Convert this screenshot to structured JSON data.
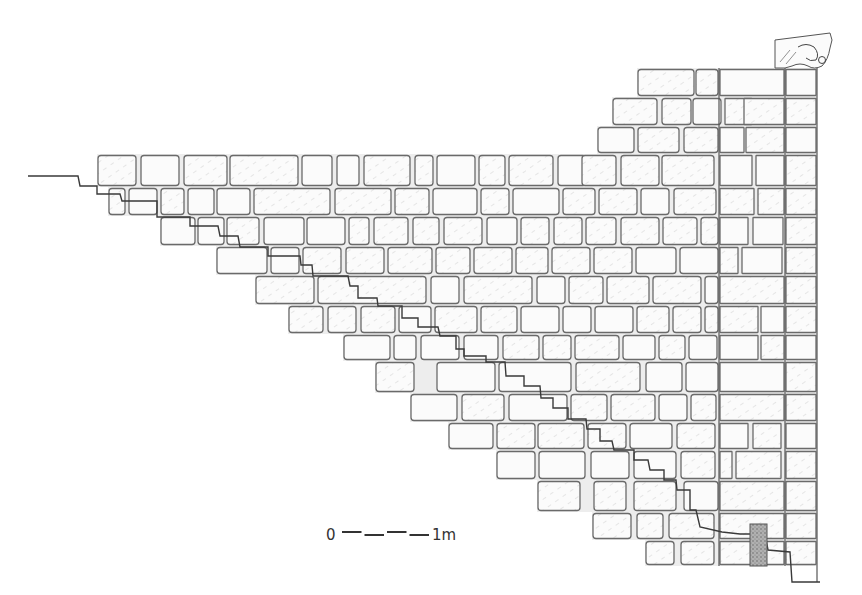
{
  "figure": {
    "scale_bar": {
      "start_label": "0",
      "end_label": "1m",
      "x": 342,
      "y": 535,
      "length": 90,
      "segments": 4
    },
    "capital_ornament": "carved corbel",
    "colors": {
      "line": "#555555",
      "stone_fill": "#fbfbfb",
      "mortar": "#ededed",
      "hatch": "#c8c8c8",
      "patch": "#9a9a9a"
    }
  },
  "courses": [
    {
      "y": 68,
      "h": 29,
      "blocks": [
        [
          637,
          58
        ],
        [
          695,
          24
        ],
        [
          719,
          66
        ],
        [
          785,
          32
        ]
      ]
    },
    {
      "y": 97,
      "h": 29,
      "blocks": [
        [
          612,
          46
        ],
        [
          661,
          31
        ],
        [
          692,
          30
        ],
        [
          724,
          29
        ],
        [
          743,
          42
        ],
        [
          785,
          32
        ]
      ]
    },
    {
      "y": 126,
      "h": 28,
      "blocks": [
        [
          597,
          38
        ],
        [
          637,
          43
        ],
        [
          683,
          36
        ],
        [
          719,
          26
        ],
        [
          745,
          40
        ],
        [
          785,
          32
        ]
      ]
    },
    {
      "y": 154,
      "h": 33,
      "blocks": [
        [
          97,
          40
        ],
        [
          140,
          40
        ],
        [
          183,
          45
        ],
        [
          229,
          70
        ],
        [
          301,
          32
        ],
        [
          336,
          24
        ],
        [
          363,
          48
        ],
        [
          414,
          20
        ],
        [
          436,
          40
        ],
        [
          478,
          28
        ],
        [
          508,
          46
        ],
        [
          557,
          30
        ],
        [
          581,
          36
        ],
        [
          620,
          40
        ],
        [
          661,
          54
        ],
        [
          719,
          34
        ],
        [
          755,
          30
        ],
        [
          785,
          32
        ]
      ]
    },
    {
      "y": 187,
      "h": 29,
      "blocks": [
        [
          108,
          18
        ],
        [
          128,
          30
        ],
        [
          160,
          25
        ],
        [
          187,
          28
        ],
        [
          216,
          35
        ],
        [
          253,
          78
        ],
        [
          334,
          58
        ],
        [
          394,
          36
        ],
        [
          432,
          46
        ],
        [
          480,
          30
        ],
        [
          512,
          48
        ],
        [
          562,
          34
        ],
        [
          598,
          40
        ],
        [
          640,
          30
        ],
        [
          673,
          44
        ],
        [
          719,
          36
        ],
        [
          757,
          28
        ],
        [
          785,
          32
        ]
      ]
    },
    {
      "y": 216,
      "h": 30,
      "blocks": [
        [
          160,
          36
        ],
        [
          197,
          28
        ],
        [
          226,
          34
        ],
        [
          263,
          42
        ],
        [
          306,
          40
        ],
        [
          348,
          22
        ],
        [
          373,
          36
        ],
        [
          412,
          28
        ],
        [
          443,
          40
        ],
        [
          486,
          32
        ],
        [
          520,
          30
        ],
        [
          553,
          30
        ],
        [
          585,
          32
        ],
        [
          620,
          40
        ],
        [
          662,
          36
        ],
        [
          700,
          19
        ],
        [
          719,
          30
        ],
        [
          752,
          32
        ],
        [
          785,
          32
        ]
      ]
    },
    {
      "y": 246,
      "h": 29,
      "blocks": [
        [
          216,
          52
        ],
        [
          270,
          30
        ],
        [
          302,
          40
        ],
        [
          345,
          40
        ],
        [
          387,
          46
        ],
        [
          435,
          36
        ],
        [
          473,
          40
        ],
        [
          515,
          34
        ],
        [
          551,
          40
        ],
        [
          593,
          40
        ],
        [
          635,
          42
        ],
        [
          679,
          40
        ],
        [
          719,
          20
        ],
        [
          741,
          42
        ],
        [
          785,
          32
        ]
      ]
    },
    {
      "y": 275,
      "h": 30,
      "blocks": [
        [
          255,
          60
        ],
        [
          317,
          110
        ],
        [
          430,
          30
        ],
        [
          463,
          70
        ],
        [
          536,
          30
        ],
        [
          568,
          36
        ],
        [
          606,
          44
        ],
        [
          652,
          50
        ],
        [
          704,
          15
        ],
        [
          719,
          66
        ],
        [
          785,
          32
        ]
      ]
    },
    {
      "y": 305,
      "h": 29,
      "blocks": [
        [
          288,
          36
        ],
        [
          327,
          30
        ],
        [
          360,
          36
        ],
        [
          398,
          34
        ],
        [
          434,
          44
        ],
        [
          480,
          38
        ],
        [
          520,
          40
        ],
        [
          562,
          30
        ],
        [
          594,
          40
        ],
        [
          636,
          34
        ],
        [
          672,
          30
        ],
        [
          704,
          15
        ],
        [
          719,
          40
        ],
        [
          760,
          25
        ],
        [
          785,
          32
        ]
      ]
    },
    {
      "y": 334,
      "h": 27,
      "blocks": [
        [
          343,
          48
        ],
        [
          393,
          24
        ],
        [
          420,
          40
        ],
        [
          463,
          36
        ],
        [
          502,
          38
        ],
        [
          542,
          30
        ],
        [
          574,
          46
        ],
        [
          622,
          34
        ],
        [
          658,
          28
        ],
        [
          688,
          30
        ],
        [
          719,
          40
        ],
        [
          760,
          25
        ],
        [
          785,
          32
        ]
      ]
    },
    {
      "y": 361,
      "h": 32,
      "blocks": [
        [
          375,
          40
        ],
        [
          436,
          60
        ],
        [
          498,
          74
        ],
        [
          575,
          66
        ],
        [
          645,
          38
        ],
        [
          685,
          34
        ],
        [
          719,
          66
        ],
        [
          785,
          32
        ]
      ]
    },
    {
      "y": 393,
      "h": 29,
      "blocks": [
        [
          410,
          48
        ],
        [
          461,
          44
        ],
        [
          508,
          60
        ],
        [
          570,
          38
        ],
        [
          610,
          46
        ],
        [
          658,
          30
        ],
        [
          690,
          27
        ],
        [
          719,
          66
        ],
        [
          785,
          32
        ]
      ]
    },
    {
      "y": 422,
      "h": 28,
      "blocks": [
        [
          448,
          46
        ],
        [
          496,
          40
        ],
        [
          537,
          48
        ],
        [
          587,
          40
        ],
        [
          629,
          44
        ],
        [
          676,
          40
        ],
        [
          719,
          30
        ],
        [
          752,
          30
        ],
        [
          785,
          32
        ]
      ]
    },
    {
      "y": 450,
      "h": 30,
      "blocks": [
        [
          496,
          40
        ],
        [
          538,
          48
        ],
        [
          590,
          40
        ],
        [
          633,
          44
        ],
        [
          680,
          36
        ],
        [
          719,
          14
        ],
        [
          735,
          47
        ],
        [
          785,
          32
        ]
      ]
    },
    {
      "y": 480,
      "h": 32,
      "blocks": [
        [
          537,
          44
        ],
        [
          593,
          34
        ],
        [
          633,
          44
        ],
        [
          683,
          36
        ],
        [
          719,
          66
        ],
        [
          785,
          32
        ]
      ]
    },
    {
      "y": 512,
      "h": 28,
      "blocks": [
        [
          592,
          40
        ],
        [
          636,
          28
        ],
        [
          668,
          47
        ],
        [
          719,
          66
        ],
        [
          785,
          32
        ]
      ]
    },
    {
      "y": 540,
      "h": 26,
      "blocks": [
        [
          645,
          30
        ],
        [
          680,
          35
        ],
        [
          719,
          66
        ],
        [
          785,
          32
        ]
      ]
    }
  ],
  "profile_points": [
    [
      28,
      176
    ],
    [
      78,
      176
    ],
    [
      80,
      186
    ],
    [
      97,
      186
    ],
    [
      97,
      194
    ],
    [
      120,
      194
    ],
    [
      122,
      201
    ],
    [
      157,
      201
    ],
    [
      157,
      217
    ],
    [
      190,
      217
    ],
    [
      190,
      226
    ],
    [
      218,
      226
    ],
    [
      220,
      236
    ],
    [
      238,
      236
    ],
    [
      240,
      247
    ],
    [
      268,
      247
    ],
    [
      268,
      256
    ],
    [
      300,
      256
    ],
    [
      301,
      265
    ],
    [
      312,
      265
    ],
    [
      313,
      276
    ],
    [
      348,
      276
    ],
    [
      350,
      286
    ],
    [
      358,
      286
    ],
    [
      358,
      298
    ],
    [
      377,
      298
    ],
    [
      378,
      306
    ],
    [
      402,
      306
    ],
    [
      402,
      318
    ],
    [
      418,
      318
    ],
    [
      418,
      327
    ],
    [
      438,
      327
    ],
    [
      440,
      336
    ],
    [
      456,
      336
    ],
    [
      456,
      349
    ],
    [
      464,
      349
    ],
    [
      464,
      356
    ],
    [
      486,
      356
    ],
    [
      486,
      362
    ],
    [
      505,
      362
    ],
    [
      506,
      376
    ],
    [
      524,
      376
    ],
    [
      524,
      386
    ],
    [
      540,
      386
    ],
    [
      541,
      398
    ],
    [
      553,
      398
    ],
    [
      553,
      408
    ],
    [
      568,
      408
    ],
    [
      568,
      419
    ],
    [
      586,
      419
    ],
    [
      587,
      429
    ],
    [
      600,
      429
    ],
    [
      600,
      441
    ],
    [
      612,
      441
    ],
    [
      614,
      450
    ],
    [
      634,
      450
    ],
    [
      634,
      460
    ],
    [
      648,
      460
    ],
    [
      650,
      470
    ],
    [
      664,
      470
    ],
    [
      664,
      480
    ],
    [
      676,
      480
    ],
    [
      677,
      490
    ],
    [
      690,
      490
    ],
    [
      690,
      510
    ],
    [
      696,
      510
    ],
    [
      700,
      527
    ],
    [
      722,
      532
    ],
    [
      740,
      534
    ],
    [
      765,
      534
    ],
    [
      768,
      550
    ],
    [
      790,
      552
    ],
    [
      792,
      582
    ],
    [
      820,
      582
    ]
  ],
  "right_face_x": 817,
  "vertical_joints_x": [
    719,
    785
  ],
  "patch": {
    "x": 750,
    "y": 524,
    "w": 17,
    "h": 42
  }
}
